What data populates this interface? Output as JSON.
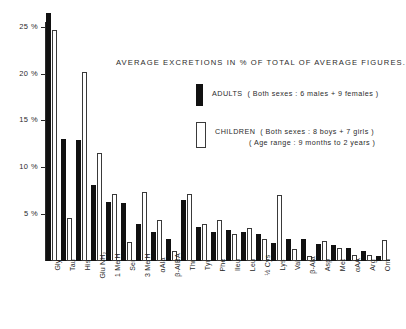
{
  "chart_data": {
    "type": "bar",
    "title": "AVERAGE EXCRETIONS IN % OF TOTAL OF AVERAGE FIGURES.",
    "xlabel": "",
    "ylabel": "",
    "ylim": [
      0,
      27
    ],
    "grid": false,
    "legend_position": "upper-right-inside",
    "y_ticks": [
      5,
      10,
      15,
      20,
      25
    ],
    "y_tick_labels": [
      "5 %",
      "10 %",
      "15 %",
      "20 %",
      "25 %"
    ],
    "categories": [
      "Gly",
      "Tau",
      "His",
      "Glu NH2",
      "1 Me H",
      "Ser",
      "3 Me H",
      "αAla",
      "β-AIBA",
      "Thr",
      "Tyr",
      "Phe",
      "Ileu",
      "Leu",
      "½ Cys",
      "Lys",
      "Val",
      "β-Ala",
      "Asp",
      "Met",
      "αAA",
      "Arg",
      "Orn"
    ],
    "category_labels_display": [
      "Gly",
      "Tau",
      "His",
      "Glu NH₂",
      "1 Me H",
      "Ser",
      "3 Me H",
      "αAla",
      "β-AIBA",
      "Thr",
      "Tyr",
      "Phe",
      "Ileu",
      "Leu",
      "½ Cys",
      "Lys",
      "Val",
      "β-Ala",
      "Asp",
      "Met",
      "αAA",
      "Arg",
      "Orn"
    ],
    "series": [
      {
        "name": "ADULTS",
        "color": "#111111",
        "style": "filled",
        "values": [
          26.5,
          13.0,
          12.9,
          8.1,
          6.3,
          6.2,
          4.0,
          3.1,
          2.3,
          6.5,
          3.6,
          3.1,
          3.3,
          3.1,
          2.9,
          1.9,
          2.3,
          2.3,
          1.8,
          1.7,
          1.4,
          1.1,
          0.5
        ]
      },
      {
        "name": "CHILDREN",
        "color": "#ffffff",
        "style": "outline",
        "values": [
          24.7,
          4.6,
          20.2,
          11.5,
          7.2,
          2.0,
          7.4,
          4.4,
          1.1,
          7.1,
          4.0,
          4.4,
          2.9,
          3.5,
          2.3,
          7.0,
          1.3,
          0.5,
          2.1,
          1.4,
          0.6,
          0.6,
          2.2
        ]
      }
    ],
    "legend": [
      {
        "series": "ADULTS",
        "label": "ADULTS",
        "detail": "( Both sexes : 6 males + 9 females )",
        "detail2": ""
      },
      {
        "series": "CHILDREN",
        "label": "CHILDREN",
        "detail": "( Both sexes : 8 boys + 7 girls )",
        "detail2": "( Age range : 9 months to 2 years )"
      }
    ]
  }
}
